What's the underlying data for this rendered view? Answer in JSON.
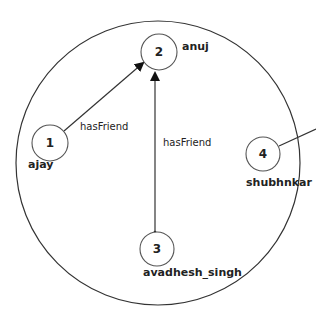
{
  "diagram": {
    "type": "graph",
    "container": {
      "cx": 158,
      "cy": 163,
      "r": 142,
      "stroke": "#222222"
    },
    "nodes": [
      {
        "id": "1",
        "label": "ajay",
        "cx": 50,
        "cy": 143
      },
      {
        "id": "2",
        "label": "anuj",
        "cx": 159,
        "cy": 52
      },
      {
        "id": "3",
        "label": "avadhesh_singh",
        "cx": 157,
        "cy": 249
      },
      {
        "id": "4",
        "label": "shubhnkar",
        "cx": 263,
        "cy": 154
      }
    ],
    "edges": [
      {
        "from": "1",
        "to": "2",
        "label": "hasFriend"
      },
      {
        "from": "3",
        "to": "2",
        "label": "hasFriend"
      },
      {
        "from": "4",
        "to": "external",
        "label": ""
      }
    ]
  }
}
